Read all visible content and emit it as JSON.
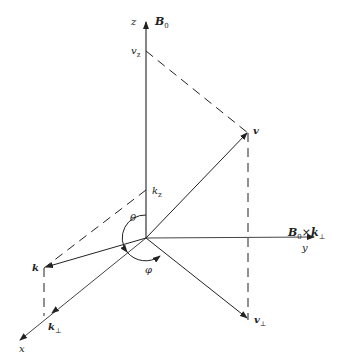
{
  "diagram": {
    "type": "3d-vector-coordinate-diagram",
    "axes": {
      "z": {
        "label": "z",
        "field_label": "B",
        "field_sub": "0"
      },
      "y": {
        "label": "y",
        "cross_label_a": "B",
        "cross_sub_a": "0",
        "cross_op": "×",
        "cross_label_b": "k",
        "cross_sub_b": "⊥"
      },
      "x": {
        "label": "x"
      }
    },
    "points": {
      "v_z": {
        "label": "v",
        "sub": "z"
      },
      "v": {
        "label": "v"
      },
      "k_z": {
        "label": "k",
        "sub": "z"
      },
      "k": {
        "label": "k"
      },
      "k_perp": {
        "label": "k",
        "sub": "⊥"
      },
      "v_perp": {
        "label": "v",
        "sub": "⊥"
      }
    },
    "angles": {
      "theta": "θ",
      "phi": "φ"
    },
    "stroke_color": "#222222",
    "background": "#ffffff"
  }
}
